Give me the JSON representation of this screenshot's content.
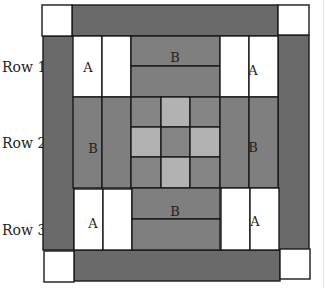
{
  "row_labels": [
    "Row 1",
    "Row 2",
    "Row 3"
  ],
  "patch_labels": {
    "a": "A",
    "b": "B"
  },
  "colors": {
    "outer_border": "#6a6a6a",
    "corner_square": "#ffffff",
    "a_patch": "#ffffff",
    "b_patch": "#7f7f7f",
    "center_dark": "#858585",
    "center_light": "#b2b2b2",
    "outline": "#1a1a1a"
  },
  "layout": {
    "rows": [
      {
        "label_index": 0,
        "left": "A",
        "center": "B",
        "right": "A"
      },
      {
        "label_index": 1,
        "left": "B",
        "center": "nine-patch",
        "right": "B"
      },
      {
        "label_index": 2,
        "left": "A",
        "center": "B",
        "right": "A"
      }
    ],
    "nine_patch": [
      [
        "dark",
        "light",
        "dark"
      ],
      [
        "light",
        "dark",
        "light"
      ],
      [
        "dark",
        "light",
        "dark"
      ]
    ]
  }
}
